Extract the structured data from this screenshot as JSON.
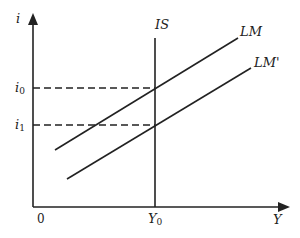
{
  "diagram": {
    "colors": {
      "ink": "#222222",
      "background": "#ffffff"
    },
    "axes": {
      "y_label": "i",
      "x_label": "Y",
      "origin_label": "0"
    },
    "curves": {
      "is": {
        "label": "IS"
      },
      "lm": {
        "label": "LM"
      },
      "lm_prime": {
        "label": "LM'"
      }
    },
    "levels": {
      "i0": {
        "base": "i",
        "sub": "0"
      },
      "i1": {
        "base": "i",
        "sub": "1"
      },
      "y0": {
        "base": "Y",
        "sub": "0"
      }
    }
  }
}
